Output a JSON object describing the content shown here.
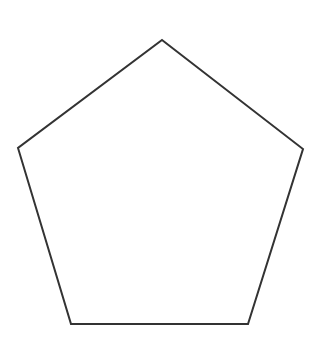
{
  "diagram": {
    "shape": "pentagon",
    "background": "#ffffff",
    "stroke_color": "#333333",
    "fill_color": "#ffffff",
    "stroke_width": 2,
    "vertices": [
      {
        "x": 162,
        "y": 40
      },
      {
        "x": 303,
        "y": 149
      },
      {
        "x": 248,
        "y": 324
      },
      {
        "x": 71,
        "y": 324
      },
      {
        "x": 18,
        "y": 148
      }
    ]
  }
}
